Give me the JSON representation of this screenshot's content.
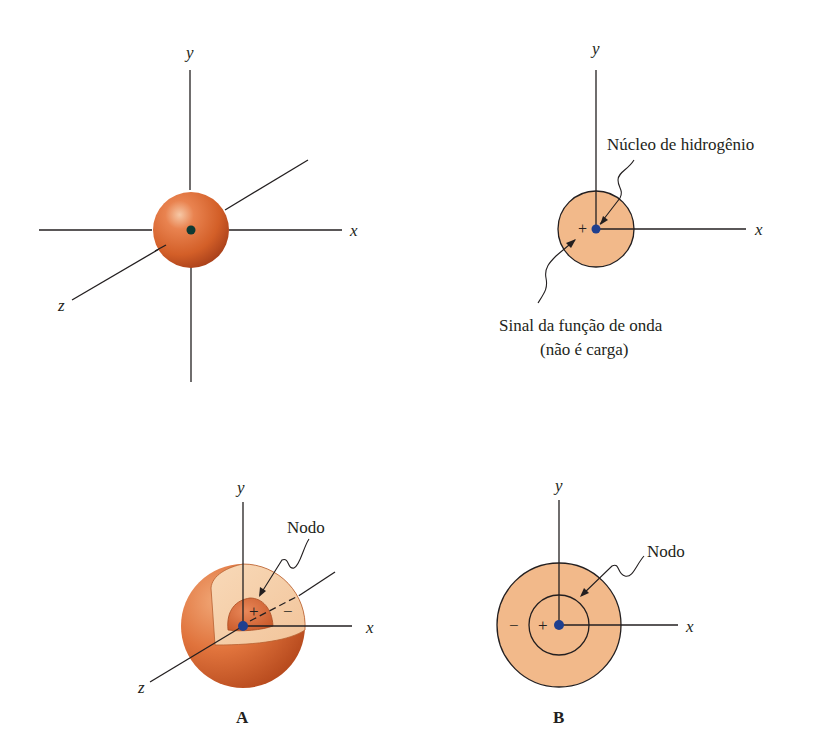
{
  "figure": {
    "panel_1s_3d": {
      "axes": {
        "x": "x",
        "y": "y",
        "z": "z"
      }
    },
    "panel_1s_2d": {
      "axes": {
        "x": "x",
        "y": "y"
      },
      "sign": "+",
      "nucleus_label": "Núcleo de hidrogênio",
      "sign_label_line1": "Sinal da função de onda",
      "sign_label_line2": "(não é carga)"
    },
    "panel_A": {
      "axes": {
        "x": "x",
        "y": "y",
        "z": "z"
      },
      "node_label": "Nodo",
      "inner_sign": "+",
      "outer_sign": "−",
      "caption": "A"
    },
    "panel_B": {
      "axes": {
        "x": "x",
        "y": "y"
      },
      "node_label": "Nodo",
      "inner_sign": "+",
      "outer_sign": "−",
      "caption": "B"
    }
  },
  "colors": {
    "orbital_dark": "#c8501f",
    "orbital_mid": "#e0733c",
    "orbital_light": "#f4c89e",
    "orbital_flat": "#f2b98a",
    "nucleus": "#1f3f8f",
    "nucleus_3d": "#0f3a33",
    "ink": "#231f20"
  }
}
